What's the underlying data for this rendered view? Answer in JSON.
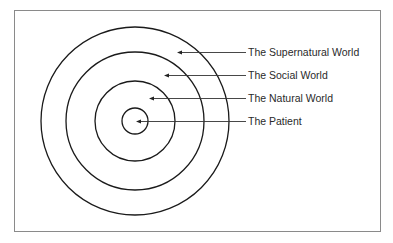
{
  "diagram": {
    "type": "concentric-circles",
    "frame": {
      "x": 14,
      "y": 10,
      "width": 366,
      "height": 221,
      "stroke": "#8a8a8a"
    },
    "center": {
      "x": 135,
      "y": 121
    },
    "stroke_color": "#1a1a1a",
    "rings": [
      {
        "name": "The Patient",
        "radius": 13
      },
      {
        "name": "The Natural World",
        "radius": 40
      },
      {
        "name": "The Social World",
        "radius": 69
      },
      {
        "name": "The Supernatural World",
        "radius": 94
      }
    ],
    "labels": [
      {
        "text": "The Supernatural World",
        "y": 52,
        "arrow_tip_x": 177
      },
      {
        "text": "The Social World",
        "y": 75,
        "arrow_tip_x": 164
      },
      {
        "text": "The Natural World",
        "y": 98,
        "arrow_tip_x": 149
      },
      {
        "text": "The Patient",
        "y": 121,
        "arrow_tip_x": 136
      }
    ],
    "label_x": 248,
    "line_end_x": 246
  }
}
